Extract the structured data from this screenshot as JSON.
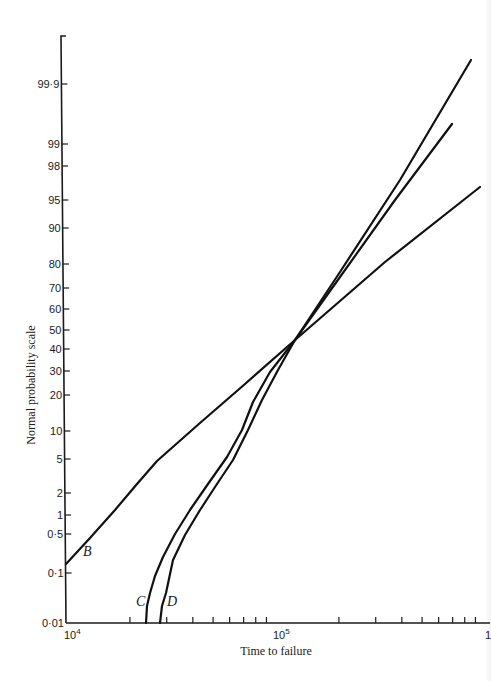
{
  "chart_data": {
    "type": "line",
    "title": "",
    "xlabel": "Time to failure",
    "ylabel": "Normal probability scale",
    "x_scale": "log",
    "y_scale": "normal-probability",
    "xlim": [
      10000,
      1000000
    ],
    "ylim": [
      0.01,
      99.99
    ],
    "x_tick_labels": [
      "10^4",
      "10^5",
      "10^6"
    ],
    "x_tick_label_display": [
      {
        "base": "10",
        "exp": "4"
      },
      {
        "base": "10",
        "exp": "5"
      },
      {
        "base": "1",
        "exp": ""
      }
    ],
    "y_tick_labels": [
      "99·9",
      "99",
      "98",
      "95",
      "90",
      "80",
      "70",
      "60",
      "50",
      "40",
      "30",
      "20",
      "10",
      "5",
      "2",
      "1",
      "0·5",
      "0·1",
      "0·01"
    ],
    "y_ticks": [
      99.9,
      99,
      98,
      95,
      90,
      80,
      70,
      60,
      50,
      40,
      30,
      20,
      10,
      5,
      2,
      1,
      0.5,
      0.1,
      0.01
    ],
    "grid": false,
    "legend": "inline curve labels",
    "series": [
      {
        "name": "B",
        "points": [
          {
            "x": 10000,
            "y": 0.15
          },
          {
            "x": 22000,
            "y": 5
          },
          {
            "x": 123000,
            "y": 50
          },
          {
            "x": 900000,
            "y": 96
          }
        ]
      },
      {
        "name": "C",
        "points": [
          {
            "x": 23500,
            "y": 0.01
          },
          {
            "x": 24000,
            "y": 0.03
          },
          {
            "x": 26000,
            "y": 0.3
          },
          {
            "x": 35000,
            "y": 2
          },
          {
            "x": 52000,
            "y": 8
          },
          {
            "x": 75000,
            "y": 20
          },
          {
            "x": 123000,
            "y": 50
          },
          {
            "x": 650000,
            "y": 99.3
          }
        ]
      },
      {
        "name": "D",
        "points": [
          {
            "x": 27500,
            "y": 0.01
          },
          {
            "x": 28500,
            "y": 0.03
          },
          {
            "x": 31000,
            "y": 0.3
          },
          {
            "x": 40000,
            "y": 2
          },
          {
            "x": 58000,
            "y": 8
          },
          {
            "x": 82000,
            "y": 20
          },
          {
            "x": 123000,
            "y": 50
          },
          {
            "x": 800000,
            "y": 99.93
          }
        ]
      }
    ],
    "annotations": [
      "B",
      "C",
      "D"
    ]
  }
}
